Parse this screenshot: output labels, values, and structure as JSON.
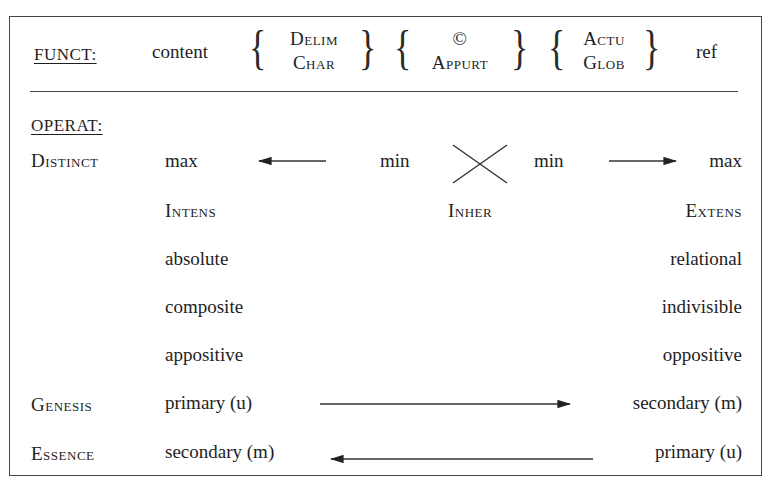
{
  "funct": {
    "label": "FUNCT:",
    "content": "content",
    "groups": [
      {
        "top": "Delim",
        "bottom": "Char"
      },
      {
        "top": "©",
        "bottom": "Appurt"
      },
      {
        "top": "Actu",
        "bottom": "Glob"
      }
    ],
    "end": "ref"
  },
  "operat": {
    "label": "OPERAT:",
    "distinct": {
      "label": "Distinct",
      "left_max": "max",
      "left_min": "min",
      "right_min": "min",
      "right_max": "max",
      "cross_icon": "x-cross",
      "left_arrow": "arrow-left",
      "right_arrow": "arrow-right"
    },
    "scale": {
      "left": "Intens",
      "center": "Inher",
      "right": "Extens"
    },
    "pairs": [
      {
        "left": "absolute",
        "right": "relational"
      },
      {
        "left": "composite",
        "right": "indivisible"
      },
      {
        "left": "appositive",
        "right": "oppositive"
      }
    ],
    "genesis": {
      "label": "Genesis",
      "left": "primary (u)",
      "right": "secondary (m)",
      "arrow": "arrow-right"
    },
    "essence": {
      "label": "Essence",
      "left": "secondary (m)",
      "right": "primary (u)",
      "arrow": "arrow-left"
    }
  }
}
